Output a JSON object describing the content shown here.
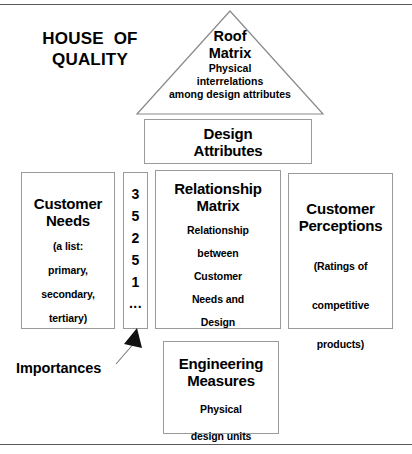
{
  "figure": {
    "title": {
      "lines": [
        "HOUSE  OF",
        "QUALITY"
      ]
    },
    "roof": {
      "name": "roof-matrix",
      "heading_line1": "Roof",
      "heading_line2": "Matrix",
      "body_line1": "Physical",
      "body_line2": "interrelations",
      "body_line3": "among  design  attributes"
    },
    "design_attributes": {
      "heading_line1": "Design",
      "heading_line2": "Attributes"
    },
    "customer_needs": {
      "heading_line1": "Customer",
      "heading_line2": "Needs",
      "body_line1": "(a  list:",
      "body_line2": "primary,",
      "body_line3": "secondary,",
      "body_line4": "tertiary)"
    },
    "importance_column": {
      "values": [
        "3",
        "5",
        "2",
        "5",
        "1",
        "..."
      ]
    },
    "relationship_matrix": {
      "heading_line1": "Relationship",
      "heading_line2": "Matrix",
      "body_line1": "Relationship",
      "body_line2": "between",
      "body_line3": "Customer",
      "body_line4": "Needs  and",
      "body_line5": "Design",
      "body_line6": "Attributes"
    },
    "customer_perceptions": {
      "heading_line1": "Customer",
      "heading_line2": "Perceptions",
      "body_line1": "(Ratings  of",
      "body_line2": "competitive",
      "body_line3": "products)"
    },
    "engineering_measures": {
      "heading_line1": "Engineering",
      "heading_line2": "Measures",
      "body_line1": "Physical",
      "body_line2": "design  units"
    },
    "annotation": {
      "importances_label": "Importances"
    },
    "colors": {
      "background": "#ffffff",
      "ink": "#000000",
      "box_border": "#9a9a9a",
      "rule": "#5a5a5a"
    }
  }
}
